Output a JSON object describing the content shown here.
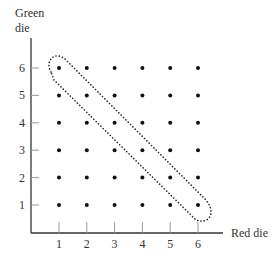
{
  "diagram": {
    "y_axis_label_line1": "Green",
    "y_axis_label_line2": "die",
    "x_axis_label": "Red die",
    "x_ticks": [
      "1",
      "2",
      "3",
      "4",
      "5",
      "6"
    ],
    "y_ticks": [
      "1",
      "2",
      "3",
      "4",
      "5",
      "6"
    ],
    "grid_points": "6x6 dots for all (red, green) outcomes",
    "highlighted_region": "dotted loop enclosing anti-diagonal points where red + green = 7",
    "highlighted_points": [
      [
        1,
        6
      ],
      [
        2,
        5
      ],
      [
        3,
        4
      ],
      [
        4,
        3
      ],
      [
        5,
        2
      ],
      [
        6,
        1
      ]
    ]
  }
}
